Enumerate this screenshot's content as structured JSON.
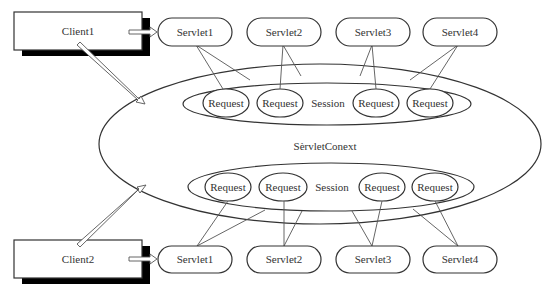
{
  "diagram": {
    "context": {
      "label": "SèrvletConext"
    },
    "clients": [
      {
        "label": "Client1"
      },
      {
        "label": "Client2"
      }
    ],
    "top_servlets": [
      {
        "label": "Servlet1"
      },
      {
        "label": "Servlet2"
      },
      {
        "label": "Servlet3"
      },
      {
        "label": "Servlet4"
      }
    ],
    "bottom_servlets": [
      {
        "label": "Servlet1"
      },
      {
        "label": "Servlet2"
      },
      {
        "label": "Servlet3"
      },
      {
        "label": "Servlet4"
      }
    ],
    "top_session": {
      "label": "Session",
      "requests": [
        {
          "label": "Request"
        },
        {
          "label": "Request"
        },
        {
          "label": "Request"
        },
        {
          "label": "Request"
        }
      ]
    },
    "bottom_session": {
      "label": "Session",
      "requests": [
        {
          "label": "Request"
        },
        {
          "label": "Request"
        },
        {
          "label": "Request"
        },
        {
          "label": "Request"
        }
      ]
    },
    "colors": {
      "stroke": "#333333",
      "shadow": "#000000",
      "background": "#ffffff"
    }
  }
}
